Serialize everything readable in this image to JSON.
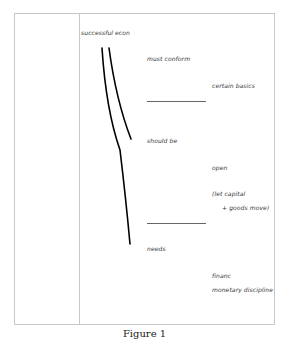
{
  "page": {
    "caption": "Figure 1"
  },
  "notes": {
    "title": "successful econ",
    "must_conform": "must conform",
    "certain_basics": "certain basics",
    "should_be": "should be",
    "open": "open",
    "let_capital": "(let capital",
    "goods_move": "+ goods move)",
    "needs": "needs",
    "financ": "financ",
    "monetary_discipline": "monetary   discipline"
  },
  "colors": {
    "ink": "#000000",
    "frame": "#c8c8c8",
    "text": "#333333"
  }
}
